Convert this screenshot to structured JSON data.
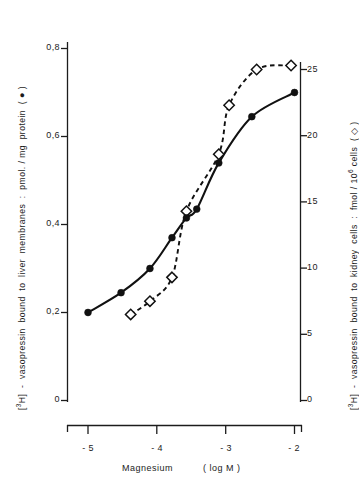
{
  "chart_data": {
    "type": "line",
    "title": "",
    "subtitle": "",
    "xlabel": "Magnesium   ( log M )",
    "xlabel_name": "Magnesium",
    "xlabel_unit": "( log M )",
    "xlim": [
      -5.35,
      -1.85
    ],
    "xticks": [
      -5,
      -4,
      -3,
      -2
    ],
    "xtick_labels": [
      "- 5",
      "- 4",
      "- 3",
      "- 2"
    ],
    "grid": false,
    "legend_position": "in-axis-labels",
    "axes": [
      {
        "side": "left",
        "label": "[3H] - vasopressin  bound  to liver  membranes :  pmol. / mg protein  ( ● )",
        "label_parts": {
          "prefix": "[",
          "superscript": "3",
          "middle": "H] - vasopressin  bound  to liver  membranes :  pmol. / mg protein  ( ",
          "marker": "●",
          "suffix": " )"
        },
        "unit": "pmol. / mg protein",
        "series_marker": "filled-circle",
        "ylim": [
          0,
          0.88
        ],
        "yticks": [
          0,
          0.2,
          0.4,
          0.6,
          0.8
        ],
        "ytick_labels": [
          "0",
          "0,2",
          "0,4",
          "0,6",
          "0,8"
        ]
      },
      {
        "side": "right",
        "label": "[3H] - vasopressin  bound  to kidney cells :  fmol / 10^6 cells  ( ◇ )",
        "label_parts": {
          "prefix": "[",
          "superscript": "3",
          "middle": "H] - vasopressin  bound  to kidney cells :  fmol / 10",
          "superscript2": "6",
          "middle2": " cells  ( ",
          "marker": "◇",
          "suffix": " )"
        },
        "unit": "fmol / 10^6 cells",
        "series_marker": "open-diamond",
        "ylim": [
          0,
          27.5
        ],
        "yticks": [
          0,
          5,
          10,
          15,
          20,
          25
        ],
        "ytick_labels": [
          "0",
          "5",
          "10",
          "15",
          "20",
          "25"
        ]
      }
    ],
    "series": [
      {
        "name": "[3H]-vasopressin bound to liver membranes",
        "marker": "filled-circle",
        "line_style": "solid",
        "axis": "left",
        "color": "#111111",
        "x": [
          -5.0,
          -4.52,
          -4.1,
          -3.78,
          -3.57,
          -3.42,
          -3.1,
          -2.62,
          -2.0
        ],
        "y": [
          0.2,
          0.245,
          0.3,
          0.37,
          0.415,
          0.435,
          0.54,
          0.645,
          0.7
        ]
      },
      {
        "name": "[3H]-vasopressin bound to kidney cells",
        "marker": "open-diamond",
        "line_style": "dashed",
        "axis": "right",
        "color": "#111111",
        "x": [
          -4.38,
          -4.1,
          -3.78,
          -3.57,
          -3.1,
          -2.95,
          -2.55,
          -2.05
        ],
        "y": [
          6.5,
          7.5,
          9.3,
          14.3,
          18.6,
          22.3,
          25.0,
          25.3
        ]
      }
    ]
  },
  "annotations": {
    "axis_line_color": "#1c1c1c"
  }
}
